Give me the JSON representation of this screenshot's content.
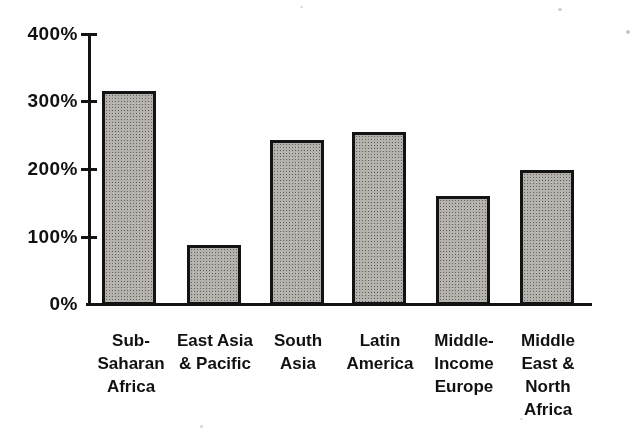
{
  "chart_data": {
    "type": "bar",
    "title": "",
    "categories": [
      "Sub-\nSaharan\nAfrica",
      "East Asia\n& Pacific",
      "South\nAsia",
      "Latin\nAmerica",
      "Middle-\nIncome\nEurope",
      "Middle\nEast &\nNorth\nAfrica"
    ],
    "values": [
      315,
      88,
      243,
      255,
      160,
      198
    ],
    "unit": "%",
    "xlabel": "",
    "ylabel": "",
    "ylim": [
      0,
      400
    ],
    "y_ticks": [
      "400%",
      "300%",
      "200%",
      "100%",
      "0%"
    ],
    "grid": false,
    "legend_position": "none",
    "bar_fill_color": "#b3b0ac",
    "bar_border_color": "#161616",
    "axis_color": "#161616",
    "text_color": "#141414",
    "background_color": "#ffffff"
  }
}
